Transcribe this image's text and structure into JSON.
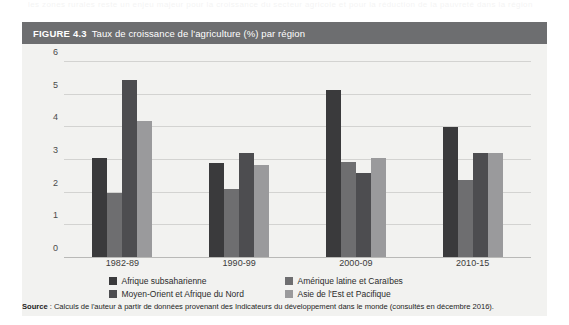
{
  "ghost_text": "les zones rurales reste un enjeu majeur pour la croissance du secteur agricole et pour la réduction de la pauvreté dans la région",
  "figure": {
    "label": "FIGURE 4.3",
    "title": "Taux de croissance de l'agriculture (%) par région",
    "header_color": "#6d6e70",
    "panel_color": "#f2f2f0"
  },
  "source": {
    "prefix": "Source",
    "text": " : Calculs de l'auteur à partir de données provenant des Indicateurs du développement dans le monde (consultés en décembre 2016)."
  },
  "chart_data": {
    "type": "bar",
    "title": "Taux de croissance de l'agriculture (%) par région",
    "xlabel": "",
    "ylabel": "",
    "ylim": [
      0,
      6
    ],
    "yticks": [
      0,
      1,
      2,
      3,
      4,
      5,
      6
    ],
    "grid": true,
    "legend_position": "bottom",
    "categories": [
      "1982-89",
      "1990-99",
      "2000-09",
      "2010-15"
    ],
    "series": [
      {
        "name": "Afrique subsaharienne",
        "color": "#3a3a3c",
        "values": [
          3.05,
          2.9,
          5.15,
          4.0
        ]
      },
      {
        "name": "Amérique latine et Caraïbes",
        "color": "#6e6e70",
        "values": [
          2.0,
          2.1,
          2.95,
          2.4
        ]
      },
      {
        "name": "Moyen-Orient et Afrique du Nord",
        "color": "#4d4d50",
        "values": [
          5.45,
          3.2,
          2.6,
          3.2
        ]
      },
      {
        "name": "Asie de l'Est et Pacifique",
        "color": "#9a9a9c",
        "values": [
          4.2,
          2.85,
          3.05,
          3.2
        ]
      }
    ]
  }
}
